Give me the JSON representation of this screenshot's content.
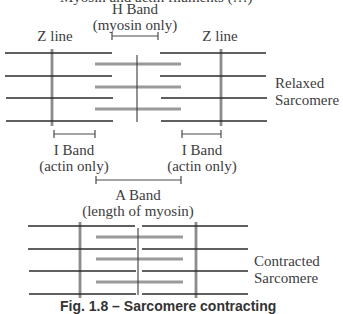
{
  "figure": {
    "top_clipped_text": "Myosin and actin filaments (…)",
    "caption": "Fig. 1.8 – Sarcomere contracting"
  },
  "labels": {
    "h_band": {
      "title": "H Band",
      "sub": "(myosin only)"
    },
    "z_line_left": "Z line",
    "z_line_right": "Z line",
    "relaxed": {
      "line1": "Relaxed",
      "line2": "Sarcomere"
    },
    "i_band_left": {
      "title": "I Band",
      "sub": "(actin only)"
    },
    "i_band_right": {
      "title": "I Band",
      "sub": "(actin only)"
    },
    "a_band": {
      "title": "A Band",
      "sub": "(length of myosin)"
    },
    "contracted": {
      "line1": "Contracted",
      "line2": "Sarcomere"
    }
  },
  "colors": {
    "actin": "#2b2b2b",
    "myosin": "#9a9a9a",
    "z_line": "#8c8c8c",
    "m_line": "#3a3a3a",
    "bracket": "#4a4a4a",
    "text": "#3d3d3d"
  },
  "relaxed_sarcomere": {
    "actin_rows_y": [
      53,
      76,
      98,
      121
    ],
    "actin_left_x": [
      5,
      112
    ],
    "actin_right_x": [
      160,
      267
    ],
    "myosin_rows_y": [
      64,
      87,
      109
    ],
    "myosin_x": [
      95,
      181
    ],
    "z_lines_x": [
      52,
      221
    ],
    "m_line_x": 137
  },
  "contracted_sarcomere": {
    "actin_rows_y": [
      226,
      249,
      271,
      294
    ],
    "actin_left_x": [
      28,
      136
    ],
    "actin_right_x": [
      142,
      248
    ],
    "myosin_rows_y": [
      237,
      259,
      282
    ],
    "myosin_x": [
      96,
      183
    ],
    "z_lines_x": [
      80,
      196
    ],
    "m_line_x": 138
  }
}
